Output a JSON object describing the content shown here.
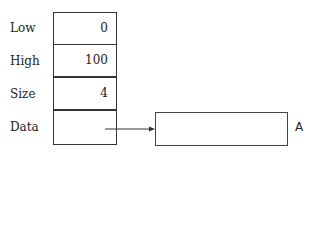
{
  "struct": {
    "fields": [
      {
        "label": "Low",
        "value": "0"
      },
      {
        "label": "High",
        "value": "100"
      },
      {
        "label": "Size",
        "value": "4"
      },
      {
        "label": "Data",
        "value": ""
      }
    ]
  },
  "array": {
    "label": "A"
  },
  "colors": {
    "line": "#333333",
    "text": "#222222"
  }
}
